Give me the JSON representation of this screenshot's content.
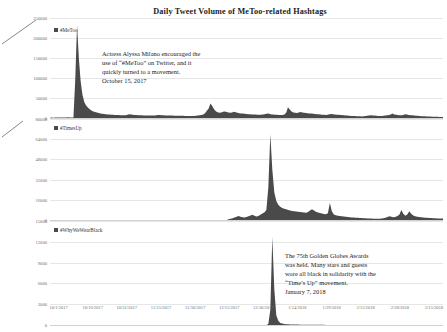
{
  "chart_data": {
    "type": "area",
    "title": "Daily Tweet Volume of MeToo-related Hashtags",
    "xlabel": "",
    "ylabel": "",
    "grid": true,
    "legend_position": "inside-top-left",
    "x_tick_labels": [
      "10/1/2017",
      "10/16/2017",
      "10/31/2017",
      "11/15/2017",
      "11/30/2017",
      "12/15/2017",
      "12/30/2017",
      "1/14/2018",
      "1/29/2018",
      "2/13/2018",
      "2/28/2018",
      "3/15/2018"
    ],
    "x_range": [
      "10/1/2017",
      "3/22/2018"
    ],
    "panels": [
      {
        "name": "metoo",
        "legend": "#MeToo",
        "ylim": [
          0,
          250000
        ],
        "y_tick_labels": [
          "250000",
          "200000",
          "150000",
          "100000",
          "50000",
          "0"
        ],
        "y_ticks": [
          250000,
          200000,
          150000,
          100000,
          50000,
          0
        ],
        "annotation": "Actress Alyssa Milano encouraged the\nuse of “#MeToo” on Twitter, and it\nquickly turned to a movement.\nOctober 15, 2017",
        "peak_value": 232000,
        "peak_date": "10/16/2017",
        "values": [
          900,
          1100,
          900,
          1000,
          1200,
          1400,
          1100,
          1000,
          1300,
          1500,
          1600,
          1300,
          1200,
          1500,
          95000,
          232000,
          150000,
          92000,
          58000,
          40000,
          31000,
          26000,
          22000,
          19000,
          16500,
          15000,
          13800,
          12500,
          11500,
          10800,
          10000,
          9500,
          9000,
          8600,
          8300,
          8000,
          7700,
          7500,
          7200,
          7000,
          6800,
          6600,
          7000,
          8200,
          9500,
          9000,
          8200,
          7600,
          7200,
          7000,
          6800,
          6600,
          6500,
          6400,
          6300,
          6200,
          6100,
          6000,
          6400,
          7000,
          7600,
          7400,
          7000,
          6700,
          6500,
          6300,
          6200,
          6100,
          6000,
          5900,
          5800,
          5700,
          5600,
          5500,
          5400,
          5300,
          5200,
          5100,
          5000,
          4900,
          5200,
          5800,
          6400,
          6800,
          7400,
          9000,
          12000,
          18000,
          24000,
          36000,
          30000,
          22000,
          17000,
          14500,
          13000,
          13500,
          15500,
          16500,
          15000,
          13500,
          13000,
          14000,
          15500,
          14500,
          13000,
          12000,
          11500,
          11000,
          10500,
          10000,
          9500,
          9200,
          9000,
          8800,
          8600,
          8400,
          8200,
          8000,
          8500,
          9500,
          10500,
          11000,
          10000,
          9000,
          8500,
          8200,
          8000,
          7800,
          7600,
          7400,
          9000,
          13000,
          27000,
          21000,
          16000,
          14000,
          13000,
          12500,
          13500,
          15000,
          14000,
          13000,
          12500,
          12000,
          11500,
          11000,
          10500,
          10000,
          9600,
          9200,
          8800,
          8400,
          8000,
          7600,
          8400,
          9200,
          9800,
          9400,
          8800,
          8400,
          8000,
          7600,
          7200,
          6800,
          6400,
          6000,
          5600,
          5200,
          5000,
          4800,
          4600,
          4400,
          4200,
          4000,
          4400,
          5000,
          5600,
          6200,
          6800,
          6400,
          6000,
          5600,
          5200,
          5000,
          4800,
          5400,
          6200,
          7000,
          7800,
          8600,
          11000,
          9000,
          8000,
          7400,
          7000,
          6600,
          7600,
          9600,
          8600,
          7600,
          7000,
          6600,
          6200,
          5800,
          5400,
          5000,
          4600,
          4400,
          4200,
          4000,
          3800,
          3600,
          3400,
          3200,
          3000,
          2900,
          2800,
          2700,
          2600
        ]
      },
      {
        "name": "timesup",
        "legend": "#TimesUp",
        "ylim": [
          0,
          80000
        ],
        "y_tick_labels": [
          "80000",
          "64000",
          "48000",
          "32000",
          "16000",
          "0"
        ],
        "y_ticks": [
          80000,
          64000,
          48000,
          32000,
          16000,
          0
        ],
        "annotation": "The 75th Golden Globes Awards\nwas held. Many stars and guests\nwore all black in solidarity with the\n“Time’s Up” movement.\nJanuary 7, 2018",
        "peak_value": 68000,
        "peak_date": "1/7/2018",
        "start_index": 90,
        "values": [
          0,
          0,
          0,
          0,
          0,
          0,
          0,
          0,
          0,
          0,
          0,
          0,
          0,
          0,
          0,
          0,
          0,
          0,
          0,
          0,
          0,
          0,
          0,
          0,
          0,
          0,
          0,
          0,
          0,
          0,
          0,
          0,
          0,
          0,
          0,
          0,
          0,
          0,
          0,
          0,
          0,
          0,
          0,
          0,
          0,
          0,
          0,
          0,
          0,
          0,
          0,
          0,
          0,
          0,
          0,
          0,
          0,
          0,
          0,
          0,
          0,
          0,
          0,
          0,
          0,
          0,
          0,
          0,
          0,
          0,
          0,
          0,
          0,
          0,
          0,
          0,
          0,
          0,
          0,
          0,
          0,
          0,
          0,
          0,
          0,
          0,
          0,
          0,
          0,
          0,
          600,
          900,
          1400,
          2000,
          2600,
          3200,
          2600,
          2200,
          1900,
          2300,
          3000,
          3600,
          4200,
          3400,
          2800,
          3200,
          4200,
          5200,
          6000,
          8000,
          26000,
          68000,
          40000,
          22000,
          15000,
          12000,
          10500,
          9500,
          9000,
          8500,
          8000,
          7600,
          7200,
          7000,
          6800,
          6600,
          6400,
          6200,
          6000,
          5800,
          6400,
          7600,
          8600,
          7600,
          6600,
          6000,
          5600,
          5200,
          4800,
          4600,
          5400,
          13500,
          7000,
          4400,
          3800,
          3400,
          3200,
          3000,
          2800,
          2600,
          2400,
          2200,
          2000,
          1900,
          1800,
          1700,
          1600,
          1500,
          1400,
          1300,
          1200,
          1150,
          1100,
          1050,
          1000,
          1000,
          1000,
          1100,
          1400,
          1800,
          2400,
          3000,
          2600,
          2200,
          2400,
          3200,
          4200,
          8000,
          5000,
          3400,
          4400,
          7000,
          5000,
          3600,
          3000,
          2600,
          2300,
          2100,
          1900,
          1800,
          1700,
          1600,
          1500,
          1400,
          1300,
          1250,
          1200,
          1150,
          1100
        ]
      },
      {
        "name": "whywewearblack",
        "legend": "#WhyWeWearBlack",
        "ylim": [
          0,
          15000
        ],
        "y_tick_labels": [
          "15000",
          "12000",
          "9000",
          "6000",
          "3000",
          "0"
        ],
        "y_ticks": [
          15000,
          12000,
          9000,
          6000,
          3000,
          0
        ],
        "annotation": "",
        "peak_value": 12700,
        "peak_date": "1/7/2018",
        "values": [
          0,
          0,
          0,
          0,
          0,
          0,
          0,
          0,
          0,
          0,
          0,
          0,
          0,
          0,
          0,
          0,
          0,
          0,
          0,
          0,
          0,
          0,
          0,
          0,
          0,
          0,
          0,
          0,
          0,
          0,
          0,
          0,
          0,
          0,
          0,
          0,
          0,
          0,
          0,
          0,
          0,
          0,
          0,
          0,
          0,
          0,
          0,
          0,
          0,
          0,
          0,
          0,
          0,
          0,
          0,
          0,
          0,
          0,
          0,
          0,
          0,
          0,
          0,
          0,
          0,
          0,
          0,
          0,
          0,
          0,
          0,
          0,
          0,
          0,
          0,
          0,
          0,
          0,
          0,
          0,
          0,
          0,
          0,
          0,
          0,
          0,
          0,
          0,
          0,
          0,
          0,
          0,
          0,
          0,
          0,
          0,
          0,
          0,
          0,
          0,
          0,
          0,
          0,
          0,
          0,
          0,
          0,
          0,
          0,
          0,
          150,
          2200,
          12700,
          5200,
          1400,
          600,
          300,
          200,
          150,
          120,
          100,
          90,
          80,
          70,
          60,
          55,
          50,
          45,
          40,
          38,
          35,
          32,
          30,
          28,
          26,
          24,
          22,
          20,
          20,
          18,
          18,
          16,
          16,
          15,
          14,
          14,
          13,
          12,
          12,
          11,
          10,
          10,
          10,
          9,
          9,
          8,
          8,
          8,
          7,
          7,
          7,
          6,
          6,
          6,
          6,
          5,
          5,
          5,
          5,
          5,
          4,
          4,
          4,
          4,
          4,
          4,
          3,
          3,
          3,
          3,
          3,
          3,
          3,
          3,
          2,
          2,
          2,
          2,
          2,
          2,
          2,
          2,
          2,
          2,
          2,
          2,
          2,
          2,
          2
        ]
      }
    ],
    "colors": {
      "series_fill": "#4a4a4a",
      "gridline": "#e6e6e6",
      "axis_text": "#6f6f6f",
      "title_text": "#1c1c1c"
    }
  }
}
